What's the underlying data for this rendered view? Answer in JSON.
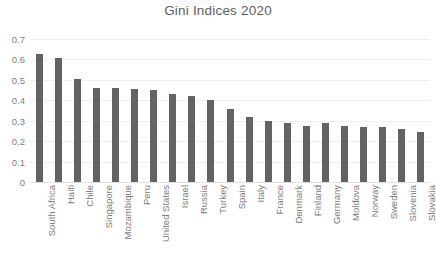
{
  "chart_data": {
    "type": "bar",
    "title": "Gini Indices 2020",
    "xlabel": "",
    "ylabel": "",
    "ylim": [
      0,
      0.7
    ],
    "yticks": [
      "0",
      "0.1",
      "0.2",
      "0.3",
      "0.4",
      "0.5",
      "0.6",
      "0.7"
    ],
    "ytick_values": [
      0,
      0.1,
      0.2,
      0.3,
      0.4,
      0.5,
      0.6,
      0.7
    ],
    "grid": true,
    "legend": false,
    "legend_position": "none",
    "bar_color": "#636363",
    "title_color": "#5e5e5e",
    "tick_color": "#808080",
    "gridline_color": "#efefef",
    "categories": [
      "South Africa",
      "Haiti",
      "Chile",
      "Singapore",
      "Mozambique",
      "Peru",
      "United States",
      "Israel",
      "Russia",
      "Turkey",
      "Spain",
      "Italy",
      "France",
      "Denmark",
      "Finland",
      "Germany",
      "Moldova",
      "Norway",
      "Sweden",
      "Slovenia",
      "Slovakia"
    ],
    "values": [
      0.625,
      0.608,
      0.503,
      0.459,
      0.458,
      0.453,
      0.452,
      0.43,
      0.42,
      0.402,
      0.355,
      0.32,
      0.3,
      0.289,
      0.275,
      0.29,
      0.275,
      0.271,
      0.268,
      0.258,
      0.247
    ],
    "series": [
      {
        "name": "Gini Index",
        "values": [
          0.625,
          0.608,
          0.503,
          0.459,
          0.458,
          0.453,
          0.452,
          0.43,
          0.42,
          0.402,
          0.355,
          0.32,
          0.3,
          0.289,
          0.275,
          0.29,
          0.275,
          0.271,
          0.268,
          0.258,
          0.247
        ]
      }
    ]
  }
}
